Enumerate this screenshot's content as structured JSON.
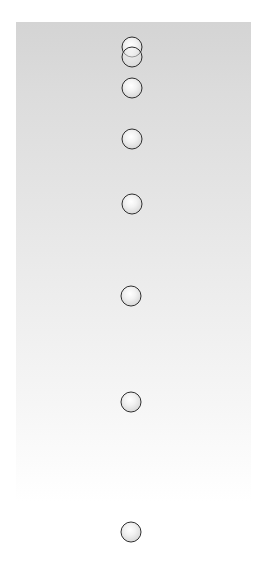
{
  "diagram": {
    "type": "motion-diagram",
    "colors": {
      "panel_top": "#d4d4d4",
      "panel_bottom": "#ffffff",
      "ball_outline": "#2e2e2e",
      "ball_fill": "#f2f2f2"
    },
    "ball_radius_px": 11,
    "positions": [
      {
        "index": 1,
        "x": 132,
        "y": 47
      },
      {
        "index": 2,
        "x": 132,
        "y": 57
      },
      {
        "index": 3,
        "x": 132,
        "y": 88
      },
      {
        "index": 4,
        "x": 132,
        "y": 139
      },
      {
        "index": 5,
        "x": 132,
        "y": 204
      },
      {
        "index": 6,
        "x": 131,
        "y": 296
      },
      {
        "index": 7,
        "x": 131,
        "y": 402
      },
      {
        "index": 8,
        "x": 131,
        "y": 532
      }
    ]
  }
}
